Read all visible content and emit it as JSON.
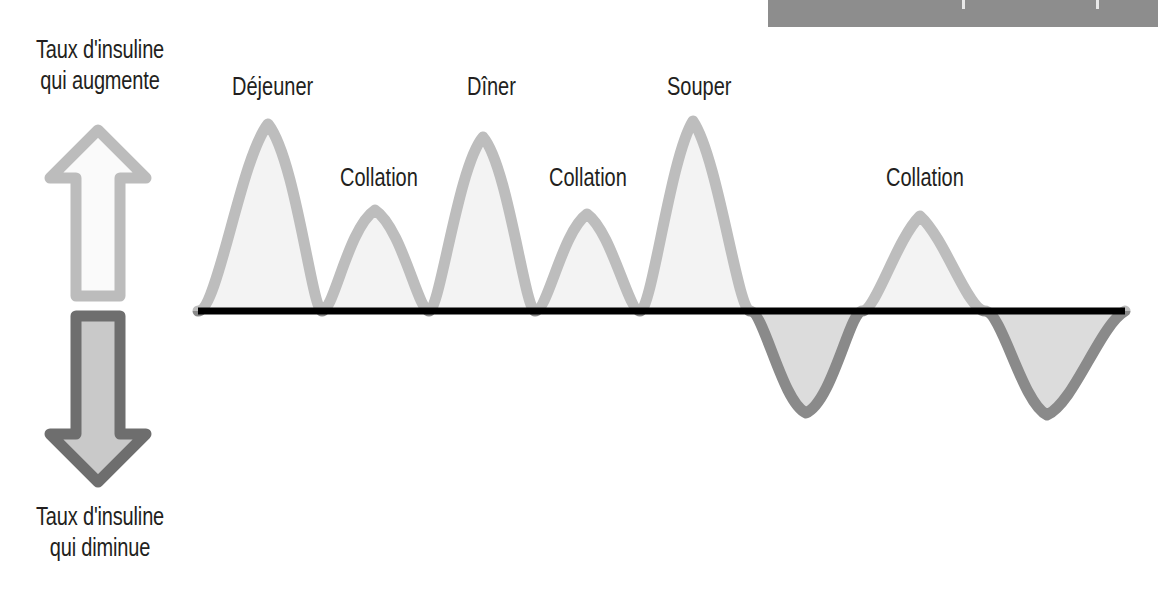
{
  "banner": {
    "color": "#8d8d8d",
    "left": 768,
    "top": 0,
    "width": 390,
    "height": 27,
    "ticks": [
      {
        "x": 194,
        "label": ""
      },
      {
        "x": 328,
        "label": ""
      }
    ]
  },
  "axis": {
    "top_caption": {
      "line1": "Taux d'insuline",
      "line2": "qui augmente"
    },
    "bottom_caption": {
      "line1": "Taux d'insuline",
      "line2": "qui diminue"
    },
    "baseline_color": "#000000",
    "baseline_x_start": 198,
    "baseline_x_end": 1125,
    "baseline_y": 311
  },
  "arrows": {
    "up": {
      "name": "Taux d'insuline qui augmente",
      "direction": "up",
      "stroke": "#bcbcbc",
      "fill": "#fafafa"
    },
    "down": {
      "name": "Taux d'insuline qui diminue",
      "direction": "down",
      "stroke": "#6e6e6e",
      "fill": "#c9c9c9"
    }
  },
  "colors": {
    "curve_positive_stroke": "#bdbdbd",
    "curve_positive_fill": "#f3f3f3",
    "curve_negative_stroke": "#8a8a8a",
    "curve_negative_fill": "#dcdcdc",
    "text": "#231f20",
    "banner": "#8d8d8d"
  },
  "labels": [
    {
      "id": "dejeuner",
      "text": "Déjeuner",
      "x": 232,
      "y": 72
    },
    {
      "id": "collation-1",
      "text": "Collation",
      "x": 340,
      "y": 163
    },
    {
      "id": "diner",
      "text": "Dîner",
      "x": 467,
      "y": 72
    },
    {
      "id": "collation-2",
      "text": "Collation",
      "x": 549,
      "y": 163
    },
    {
      "id": "souper",
      "text": "Souper",
      "x": 667,
      "y": 72
    },
    {
      "id": "collation-3",
      "text": "Collation",
      "x": 886,
      "y": 163
    }
  ],
  "chart_data": {
    "type": "line",
    "title": "",
    "subtitle": "",
    "xlabel": "",
    "ylabel": "Taux d'insuline",
    "grid": false,
    "legend": null,
    "xlim": [
      198,
      1125
    ],
    "ylim": [
      -1.05,
      1.05
    ],
    "baseline_value": 0,
    "annotations": [
      "Taux d'insuline qui augmente",
      "Taux d'insuline qui diminue",
      "Déjeuner",
      "Collation",
      "Dîner",
      "Collation",
      "Souper",
      "Collation"
    ],
    "series": [
      {
        "name": "Taux d'insuline",
        "description": "Courbe d'insuline avec pics aux repas et collations, puis oscillation sous la ligne de base",
        "peaks": [
          {
            "label": "Déjeuner",
            "x": 268,
            "amplitude": 1.0
          },
          {
            "label": "Collation",
            "x": 375,
            "amplitude": 0.55
          },
          {
            "label": "Dîner",
            "x": 483,
            "amplitude": 0.95
          },
          {
            "label": "Collation",
            "x": 587,
            "amplitude": 0.53
          },
          {
            "label": "Souper",
            "x": 693,
            "amplitude": 1.02
          },
          {
            "label": "Collation",
            "x": 920,
            "amplitude": 0.69
          }
        ],
        "troughs": [
          {
            "x": 806,
            "amplitude": -0.66
          },
          {
            "x": 1047,
            "amplitude": -0.68
          }
        ],
        "zero_crossings": [
          198,
          322,
          429,
          535,
          640,
          750,
          862,
          985,
          1125
        ],
        "path": "M 198 311 C 218 311 240 160 268 124 C 296 160 312 311 322 311 C 334 311 348 228 375 210 C 402 228 418 311 429 311 C 440 311 458 166 483 137 C 508 166 525 311 535 311 C 548 311 562 232 587 214 C 612 232 628 311 640 311 C 652 311 670 158 693 121 C 718 158 738 311 750 311 C 764 311 782 402 806 413 C 832 402 850 311 862 311 C 876 311 896 240 920 216 C 946 240 968 311 985 311 C 1002 311 1022 403 1047 415 C 1074 403 1100 325 1125 311"
      }
    ]
  }
}
